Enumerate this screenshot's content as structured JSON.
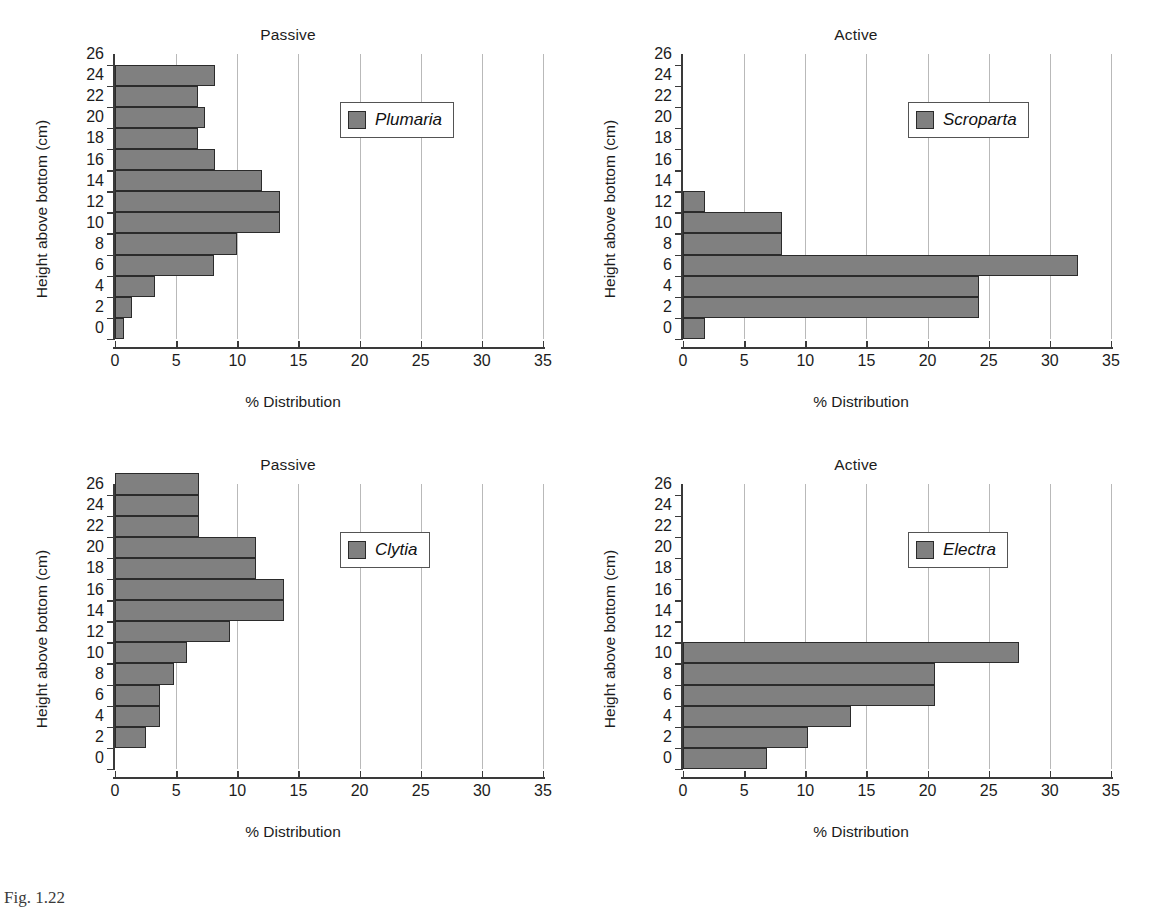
{
  "figure": {
    "caption_fragment": "Fig. 1.22",
    "bar_color": "#808080",
    "bar_edge_color": "#2b2b2b",
    "grid_color": "#b9b9b9",
    "axis_color": "#3a3a3a"
  },
  "chart_data": [
    {
      "id": "plumaria",
      "type": "bar",
      "orientation": "horizontal",
      "title": "Passive",
      "xlabel": "% Distribution",
      "ylabel": "Height above bottom (cm)",
      "legend": "Plumaria",
      "legend_position": "top-right",
      "grid": true,
      "xlim": [
        0,
        35
      ],
      "xticks": [
        0,
        5,
        10,
        15,
        20,
        25,
        30,
        35
      ],
      "ylim": [
        0,
        27
      ],
      "yticks": [
        0,
        2,
        4,
        6,
        8,
        10,
        12,
        14,
        16,
        18,
        20,
        22,
        24,
        26
      ],
      "categories": [
        0,
        2,
        4,
        6,
        8,
        10,
        12,
        14,
        16,
        18,
        20,
        22,
        24,
        26
      ],
      "values": [
        0.7,
        1.4,
        3.3,
        8.1,
        10.0,
        13.5,
        13.5,
        12.0,
        8.2,
        6.8,
        7.4,
        6.8,
        8.2,
        0
      ]
    },
    {
      "id": "scroparta",
      "type": "bar",
      "orientation": "horizontal",
      "title": "Active",
      "xlabel": "% Distribution",
      "ylabel": "Height above bottom (cm)",
      "legend": "Scroparta",
      "legend_position": "top-right",
      "grid": true,
      "xlim": [
        0,
        35
      ],
      "xticks": [
        0,
        5,
        10,
        15,
        20,
        25,
        30,
        35
      ],
      "ylim": [
        0,
        27
      ],
      "yticks": [
        0,
        2,
        4,
        6,
        8,
        10,
        12,
        14,
        16,
        18,
        20,
        22,
        24,
        26
      ],
      "categories": [
        0,
        2,
        4,
        6,
        8,
        10,
        12,
        14,
        16,
        18,
        20,
        22,
        24,
        26
      ],
      "values": [
        1.8,
        24.2,
        24.2,
        32.3,
        8.1,
        8.1,
        1.8,
        0,
        0,
        0,
        0,
        0,
        0,
        0
      ]
    },
    {
      "id": "clytia",
      "type": "bar",
      "orientation": "horizontal",
      "title": "Passive",
      "xlabel": "% Distribution",
      "ylabel": "Height above bottom (cm)",
      "legend": "Clytia",
      "legend_position": "top-right",
      "grid": true,
      "xlim": [
        0,
        35
      ],
      "xticks": [
        0,
        5,
        10,
        15,
        20,
        25,
        30,
        35
      ],
      "ylim": [
        0,
        27
      ],
      "yticks": [
        0,
        2,
        4,
        6,
        8,
        10,
        12,
        14,
        16,
        18,
        20,
        22,
        24,
        26
      ],
      "categories": [
        0,
        2,
        4,
        6,
        8,
        10,
        12,
        14,
        16,
        18,
        20,
        22,
        24,
        26
      ],
      "values": [
        0,
        2.5,
        3.7,
        3.7,
        4.8,
        5.9,
        9.4,
        13.8,
        13.8,
        11.5,
        11.5,
        6.9,
        6.9,
        6.9
      ]
    },
    {
      "id": "electra",
      "type": "bar",
      "orientation": "horizontal",
      "title": "Active",
      "xlabel": "% Distribution",
      "ylabel": "Height above bottom (cm)",
      "legend": "Electra",
      "legend_position": "top-right",
      "grid": true,
      "xlim": [
        0,
        35
      ],
      "xticks": [
        0,
        5,
        10,
        15,
        20,
        25,
        30,
        35
      ],
      "ylim": [
        0,
        27
      ],
      "yticks": [
        0,
        2,
        4,
        6,
        8,
        10,
        12,
        14,
        16,
        18,
        20,
        22,
        24,
        26
      ],
      "categories": [
        0,
        2,
        4,
        6,
        8,
        10,
        12,
        14,
        16,
        18,
        20,
        22,
        24,
        26
      ],
      "values": [
        6.9,
        10.2,
        13.7,
        20.6,
        20.6,
        27.5,
        0,
        0,
        0,
        0,
        0,
        0,
        0,
        0
      ]
    }
  ]
}
